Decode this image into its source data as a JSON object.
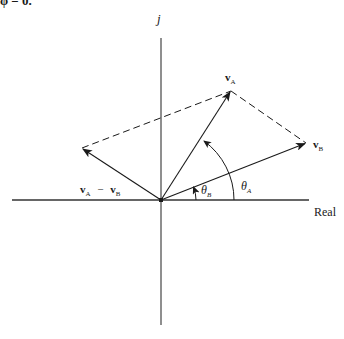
{
  "header_fragment": "φ = 0.",
  "axes": {
    "vertical_label": "j",
    "horizontal_label": "Real"
  },
  "vectors": {
    "va": {
      "symbol": "v",
      "subscript": "A"
    },
    "vb": {
      "symbol": "v",
      "subscript": "B"
    },
    "diff": {
      "a_symbol": "v",
      "a_sub": "A",
      "op": "−",
      "b_symbol": "v",
      "b_sub": "B"
    }
  },
  "angles": {
    "theta_a": {
      "symbol": "θ",
      "subscript": "A"
    },
    "theta_b": {
      "symbol": "θ",
      "subscript": "B"
    }
  },
  "colors": {
    "line": "#1a1a1a",
    "axis": "#333333",
    "background": "#ffffff"
  }
}
